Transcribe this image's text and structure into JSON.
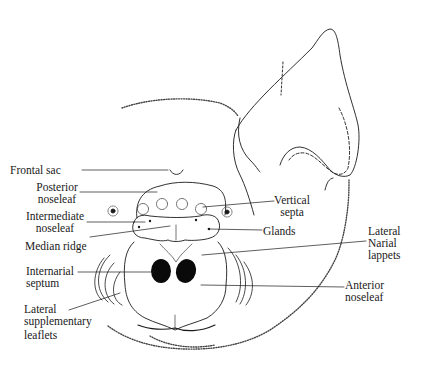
{
  "diagram": {
    "labels": {
      "frontal_sac": "Frontal sac",
      "posterior_noseleaf_1": "Posterior",
      "posterior_noseleaf_2": "noseleaf",
      "intermediate_noseleaf_1": "Intermediate",
      "intermediate_noseleaf_2": "noseleaf",
      "median_ridge": "Median ridge",
      "internarial_septum_1": "Internarial",
      "internarial_septum_2": "septum",
      "lateral_supplementary_1": "Lateral",
      "lateral_supplementary_2": "supplementary",
      "lateral_supplementary_3": "leaflets",
      "vertical_septa_1": "Vertical",
      "vertical_septa_2": "septa",
      "glands": "Glands",
      "lateral_narial_1": "Lateral",
      "lateral_narial_2": "Narial",
      "lateral_narial_3": "lappets",
      "anterior_noseleaf_1": "Anterior",
      "anterior_noseleaf_2": "noseleaf"
    },
    "colors": {
      "ink": "#1a1a1a",
      "background": "#ffffff"
    }
  }
}
